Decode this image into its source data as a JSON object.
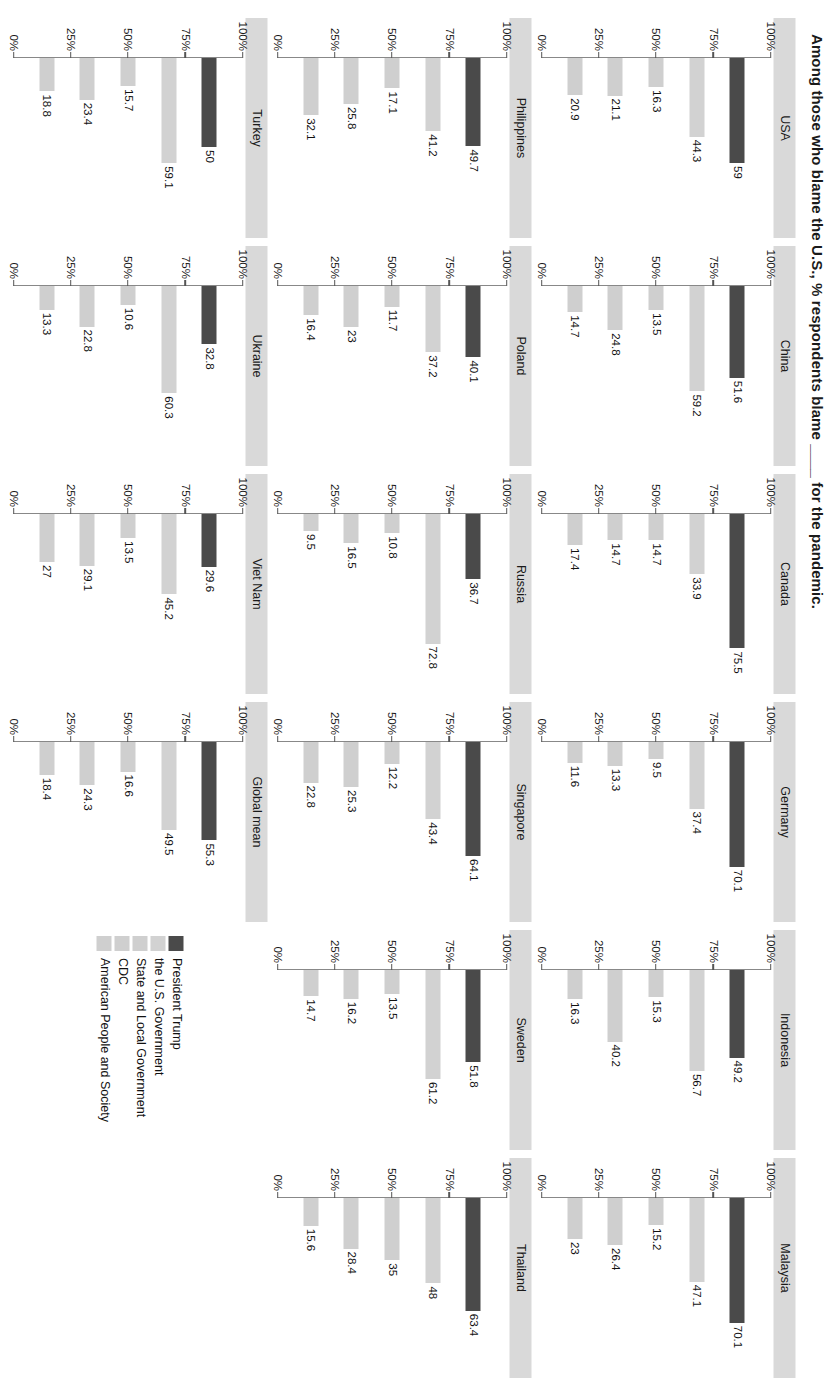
{
  "chart_data": {
    "type": "bar",
    "title": "Among those who blame the U.S., % respondents blame ____ for the pandemic.",
    "xlabel": "",
    "ylabel": "",
    "orientation": "horizontal",
    "ylim": [
      0,
      100
    ],
    "grid": false,
    "legend_position": "bottom-right",
    "tick_labels": [
      "100%",
      "75%",
      "50%",
      "25%",
      "0%"
    ],
    "tick_values": [
      100,
      75,
      50,
      25,
      0
    ],
    "series_names": [
      "President Trump",
      "the U.S. Government",
      "State and Local Government",
      "CDC",
      "American People and Society"
    ],
    "series_colors": [
      "#4a4a4a",
      "#d2d2d2",
      "#cfcfcf",
      "#cfcfcf",
      "#cfcfcf"
    ],
    "panels": [
      {
        "name": "USA",
        "values": [
          59,
          44.3,
          16.3,
          21.1,
          20.9
        ]
      },
      {
        "name": "China",
        "values": [
          51.6,
          59.2,
          13.5,
          24.8,
          14.7
        ]
      },
      {
        "name": "Canada",
        "values": [
          75.5,
          33.9,
          14.7,
          14.7,
          17.4
        ]
      },
      {
        "name": "Germany",
        "values": [
          70.1,
          37.4,
          9.5,
          13.3,
          11.6
        ]
      },
      {
        "name": "Indonesia",
        "values": [
          49.2,
          56.7,
          15.3,
          40.2,
          16.3
        ]
      },
      {
        "name": "Malaysia",
        "values": [
          70.1,
          47.1,
          15.2,
          26.4,
          23
        ]
      },
      {
        "name": "Philippines",
        "values": [
          49.7,
          41.2,
          17.1,
          25.8,
          32.1
        ]
      },
      {
        "name": "Poland",
        "values": [
          40.1,
          37.2,
          11.7,
          23,
          16.4
        ]
      },
      {
        "name": "Russia",
        "values": [
          36.7,
          72.8,
          10.8,
          16.5,
          9.5
        ]
      },
      {
        "name": "Singapore",
        "values": [
          64.1,
          43.4,
          12.2,
          25.3,
          22.8
        ]
      },
      {
        "name": "Sweden",
        "values": [
          51.8,
          61.2,
          13.5,
          16.2,
          14.7
        ]
      },
      {
        "name": "Thailand",
        "values": [
          63.4,
          48,
          35,
          28.4,
          15.6
        ]
      },
      {
        "name": "Turkey",
        "values": [
          50,
          59.1,
          15.7,
          23.4,
          18.8
        ]
      },
      {
        "name": "Ukraine",
        "values": [
          32.8,
          60.3,
          10.6,
          22.8,
          13.3
        ]
      },
      {
        "name": "Viet Nam",
        "values": [
          29.6,
          45.2,
          13.5,
          29.1,
          27
        ]
      },
      {
        "name": "Global mean",
        "values": [
          55.3,
          49.5,
          16.6,
          24.3,
          18.4
        ]
      }
    ]
  }
}
